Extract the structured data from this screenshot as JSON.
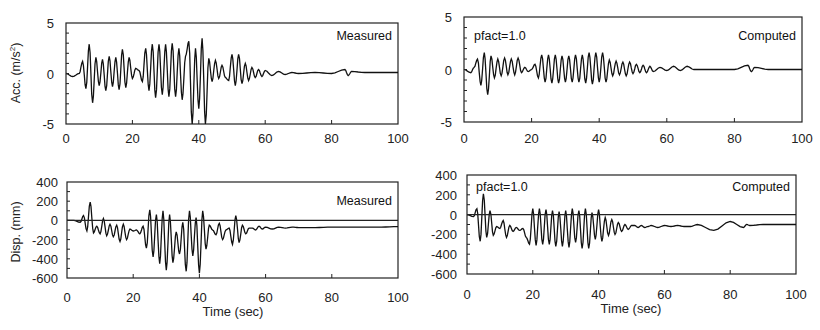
{
  "chart_data": [
    {
      "type": "line",
      "panel": "top-left",
      "title": "",
      "annotation": "Measured",
      "xlabel": "",
      "ylabel": "Acc. (m/s²)",
      "xlim": [
        0,
        100
      ],
      "ylim": [
        -5,
        5
      ],
      "xticks": [
        "0",
        "20",
        "40",
        "60",
        "80",
        "100"
      ],
      "yticks": [
        "5",
        "0",
        "-5"
      ],
      "zero_line": false,
      "series": [
        {
          "name": "Measured acceleration",
          "x": [
            0,
            2,
            4,
            5,
            6,
            7,
            8,
            9,
            10,
            11,
            12,
            13,
            14,
            15,
            16,
            17,
            18,
            19,
            20,
            21,
            22,
            23,
            24,
            25,
            26,
            27,
            28,
            29,
            30,
            31,
            32,
            33,
            34,
            35,
            36,
            37,
            38,
            39,
            40,
            41,
            42,
            43,
            44,
            45,
            46,
            47,
            48,
            49,
            50,
            51,
            52,
            53,
            54,
            55,
            56,
            57,
            58,
            59,
            60,
            62,
            64,
            66,
            68,
            70,
            75,
            80,
            84,
            85,
            86,
            90,
            95,
            100
          ],
          "values": [
            0,
            -0.3,
            0,
            1.2,
            -1.5,
            2.9,
            -2.9,
            1.6,
            -1.2,
            1.4,
            -1.7,
            1.7,
            -1.3,
            1.6,
            -1.6,
            2.4,
            -1.4,
            1.6,
            -0.5,
            0.5,
            0.3,
            -0.8,
            2.5,
            -1.7,
            2.9,
            -2.4,
            2.9,
            -2.1,
            2.9,
            -2.3,
            3.0,
            -2.3,
            2.5,
            -2.6,
            1.7,
            3.2,
            -5,
            2.5,
            -3.5,
            3.5,
            -5,
            1.5,
            -0.8,
            1.3,
            -0.5,
            0.8,
            -0.4,
            -0.7,
            1.9,
            -1.2,
            1.9,
            -1,
            1.0,
            -0.7,
            0.6,
            -0.4,
            0.4,
            -0.3,
            0.3,
            -0.2,
            0.2,
            -0.1,
            0.1,
            0,
            0.1,
            0,
            0.4,
            -0.2,
            0.2,
            0.1,
            0.1,
            0.1
          ]
        }
      ]
    },
    {
      "type": "line",
      "panel": "top-right",
      "title": "",
      "annotation": "Computed",
      "parameter_label": "pfact=1.0",
      "xlabel": "",
      "ylabel": "",
      "xlim": [
        0,
        100
      ],
      "ylim": [
        -5,
        5
      ],
      "xticks": [
        "0",
        "20",
        "40",
        "60",
        "80",
        "100"
      ],
      "yticks": [
        "5",
        "0",
        "-5"
      ],
      "zero_line": false,
      "series": [
        {
          "name": "Computed acceleration",
          "x": [
            0,
            2,
            3,
            4,
            5,
            6,
            7,
            8,
            9,
            10,
            11,
            12,
            13,
            14,
            15,
            16,
            17,
            18,
            19,
            20,
            21,
            22,
            23,
            24,
            25,
            26,
            27,
            28,
            29,
            30,
            31,
            32,
            33,
            34,
            35,
            36,
            37,
            38,
            39,
            40,
            41,
            42,
            43,
            44,
            45,
            46,
            47,
            48,
            49,
            50,
            51,
            52,
            53,
            54,
            55,
            56,
            58,
            60,
            62,
            64,
            66,
            68,
            70,
            75,
            80,
            84,
            85,
            86,
            90,
            95,
            100
          ],
          "values": [
            0,
            -0.3,
            0.2,
            1,
            -1.5,
            1.6,
            -2.4,
            1.3,
            -0.8,
            1.0,
            -0.6,
            1.1,
            -0.5,
            1.0,
            -0.5,
            1.1,
            -0.3,
            0.2,
            -0.2,
            0,
            0.5,
            -0.8,
            1.4,
            -1.2,
            1.4,
            -1.3,
            1.4,
            -1.3,
            1.3,
            -1.2,
            1.3,
            -1.2,
            1.4,
            -1.2,
            1.4,
            -1.3,
            1.6,
            -1.4,
            1.6,
            -1.2,
            1.6,
            -1.2,
            0.9,
            -0.6,
            0.8,
            -0.5,
            0.7,
            -0.6,
            0.7,
            -0.4,
            0.5,
            -0.3,
            0.4,
            -0.3,
            0.3,
            -0.2,
            0.2,
            -0.1,
            0.3,
            -0.1,
            0.3,
            0,
            0,
            0,
            0,
            0.4,
            -0.2,
            0.2,
            0,
            0,
            0
          ]
        }
      ]
    },
    {
      "type": "line",
      "panel": "bottom-left",
      "title": "",
      "annotation": "Measured",
      "xlabel": "Time (sec)",
      "ylabel": "Disp. (mm)",
      "xlim": [
        0,
        100
      ],
      "ylim": [
        -600,
        400
      ],
      "xticks": [
        "0",
        "20",
        "40",
        "60",
        "80",
        "100"
      ],
      "yticks": [
        "400",
        "200",
        "0",
        "-200",
        "-400",
        "-600"
      ],
      "zero_line": true,
      "series": [
        {
          "name": "Measured displacement",
          "x": [
            0,
            2,
            4,
            5,
            6,
            7,
            8,
            9,
            10,
            11,
            12,
            13,
            14,
            15,
            16,
            17,
            18,
            19,
            20,
            21,
            22,
            23,
            24,
            25,
            26,
            27,
            28,
            29,
            30,
            31,
            32,
            33,
            34,
            35,
            36,
            37,
            38,
            39,
            40,
            41,
            42,
            43,
            44,
            45,
            46,
            47,
            48,
            49,
            50,
            51,
            52,
            53,
            54,
            55,
            56,
            57,
            58,
            59,
            60,
            62,
            64,
            66,
            68,
            70,
            75,
            80,
            85,
            90,
            95,
            100
          ],
          "values": [
            0,
            0,
            -20,
            50,
            -110,
            190,
            -130,
            -60,
            -140,
            20,
            -160,
            -40,
            -170,
            -50,
            -220,
            -40,
            -200,
            -90,
            -110,
            -100,
            -140,
            -60,
            -290,
            110,
            -380,
            60,
            -450,
            100,
            -520,
            60,
            -440,
            -120,
            -350,
            -20,
            -530,
            100,
            -370,
            30,
            -550,
            100,
            -300,
            -50,
            -100,
            -150,
            -30,
            -200,
            -100,
            -80,
            -250,
            50,
            -230,
            -50,
            -140,
            -80,
            -80,
            -100,
            -60,
            -90,
            -70,
            -90,
            -70,
            -80,
            -70,
            -75,
            -75,
            -70,
            -70,
            -70,
            -70,
            -65
          ]
        }
      ]
    },
    {
      "type": "line",
      "panel": "bottom-right",
      "title": "",
      "annotation": "Computed",
      "parameter_label": "pfact=1.0",
      "xlabel": "Time (sec)",
      "ylabel": "",
      "xlim": [
        0,
        100
      ],
      "ylim": [
        -600,
        400
      ],
      "xticks": [
        "0",
        "20",
        "40",
        "60",
        "80",
        "100"
      ],
      "yticks": [
        "400",
        "200",
        "0",
        "-200",
        "-400",
        "-600"
      ],
      "zero_line": true,
      "series": [
        {
          "name": "Computed displacement",
          "x": [
            0,
            2,
            3,
            4,
            5,
            6,
            7,
            8,
            9,
            10,
            11,
            12,
            13,
            14,
            15,
            16,
            17,
            18,
            19,
            20,
            21,
            22,
            23,
            24,
            25,
            26,
            27,
            28,
            29,
            30,
            31,
            32,
            33,
            34,
            35,
            36,
            37,
            38,
            39,
            40,
            41,
            42,
            43,
            44,
            45,
            46,
            47,
            48,
            49,
            50,
            51,
            52,
            53,
            54,
            55,
            56,
            58,
            60,
            62,
            64,
            66,
            68,
            70,
            75,
            80,
            84,
            85,
            86,
            90,
            95,
            100
          ],
          "values": [
            0,
            -20,
            60,
            -270,
            210,
            -230,
            40,
            -210,
            -120,
            -140,
            -60,
            -230,
            -110,
            -170,
            -130,
            -160,
            -140,
            -230,
            -300,
            60,
            -310,
            60,
            -300,
            50,
            -300,
            40,
            -320,
            30,
            -320,
            40,
            -330,
            60,
            -280,
            40,
            -340,
            60,
            -340,
            20,
            -250,
            50,
            -270,
            -30,
            -210,
            -50,
            -200,
            -80,
            -170,
            -100,
            -150,
            -110,
            -110,
            -130,
            -110,
            -130,
            -120,
            -110,
            -130,
            -110,
            -120,
            -110,
            -120,
            -120,
            -100,
            -160,
            -70,
            -130,
            -100,
            -110,
            -100,
            -100,
            -100
          ]
        }
      ]
    }
  ],
  "panels": {
    "tl": {
      "annotation": "Measured",
      "ylabel": "Acc. (m/s",
      "ylabel_sup": "2",
      "ylabel_close": ")"
    },
    "tr": {
      "annotation": "Computed",
      "param": "pfact=1.0"
    },
    "bl": {
      "annotation": "Measured",
      "ylabel": "Disp. (mm)",
      "xlabel": "Time (sec)"
    },
    "br": {
      "annotation": "Computed",
      "param": "pfact=1.0",
      "xlabel": "Time (sec)"
    }
  },
  "ticks": {
    "x": [
      "0",
      "20",
      "40",
      "60",
      "80",
      "100"
    ],
    "acc_y": [
      "5",
      "0",
      "-5"
    ],
    "disp_y": [
      "400",
      "200",
      "0",
      "-200",
      "-400",
      "-600"
    ]
  },
  "colors": {
    "line": "#111111",
    "axis": "#222222",
    "background": "#ffffff"
  }
}
